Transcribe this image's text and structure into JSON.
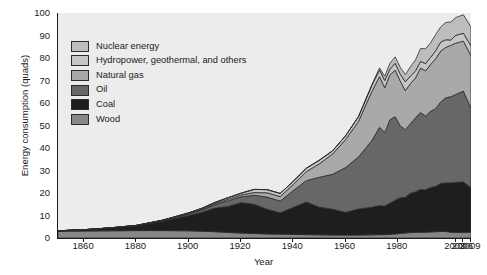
{
  "chart_data": {
    "type": "area",
    "stacked": true,
    "title": "",
    "xlabel": "Year",
    "ylabel": "Energy consumption (quads)",
    "ylim": [
      0,
      100
    ],
    "yticks": [
      0,
      10,
      20,
      30,
      40,
      50,
      60,
      70,
      80,
      90,
      100
    ],
    "xticks": [
      "1860",
      "1880",
      "1900",
      "1920",
      "1940",
      "1960",
      "1980",
      "2003",
      "2006",
      "2009"
    ],
    "xtick_note": "Axis spacing is non-uniform: 1850-1980 is linear, then 2003, 2006, 2009 are compressed at the right.",
    "grid": false,
    "legend_position": "upper-left-inside",
    "x": [
      1850,
      1860,
      1870,
      1880,
      1890,
      1900,
      1905,
      1910,
      1915,
      1920,
      1925,
      1930,
      1935,
      1940,
      1945,
      1950,
      1955,
      1960,
      1965,
      1970,
      1973,
      1975,
      1977,
      1979,
      1981,
      1983,
      1985,
      1987,
      1989,
      1991,
      1993,
      1995,
      1997,
      1999,
      2001,
      2003,
      2006,
      2009
    ],
    "series": [
      {
        "name": "Wood",
        "color": "#878787",
        "values": [
          3.0,
          3.1,
          3.2,
          3.3,
          3.3,
          3.2,
          3.0,
          2.8,
          2.5,
          2.2,
          2.0,
          1.8,
          1.7,
          1.6,
          1.5,
          1.4,
          1.3,
          1.3,
          1.3,
          1.4,
          1.5,
          1.5,
          1.6,
          1.8,
          2.0,
          2.2,
          2.4,
          2.5,
          2.6,
          2.6,
          2.7,
          2.8,
          2.9,
          2.9,
          2.6,
          2.5,
          2.5,
          2.6
        ]
      },
      {
        "name": "Coal",
        "color": "#1e1e1e",
        "values": [
          0.2,
          0.6,
          1.2,
          2.1,
          4.1,
          6.8,
          8.4,
          10.5,
          11.5,
          13.5,
          13.0,
          11.0,
          9.5,
          12.0,
          14.5,
          12.3,
          11.5,
          10.1,
          11.6,
          12.3,
          12.9,
          12.7,
          13.9,
          15.0,
          15.9,
          15.9,
          17.5,
          18.0,
          19.0,
          18.8,
          19.8,
          20.1,
          21.4,
          21.6,
          21.9,
          22.3,
          22.4,
          19.7
        ]
      },
      {
        "name": "Oil",
        "color": "#676767",
        "values": [
          0.0,
          0.0,
          0.1,
          0.2,
          0.4,
          0.6,
          1.0,
          1.5,
          2.5,
          2.6,
          4.0,
          5.4,
          5.2,
          7.5,
          9.5,
          13.3,
          15.5,
          19.9,
          23.2,
          29.5,
          34.8,
          32.7,
          37.1,
          37.1,
          31.9,
          30.0,
          30.9,
          32.9,
          34.2,
          32.8,
          33.8,
          34.6,
          36.2,
          37.8,
          38.3,
          39.0,
          40.4,
          35.3
        ]
      },
      {
        "name": "Natural gas",
        "color": "#a9a9a9",
        "values": [
          0.0,
          0.0,
          0.0,
          0.0,
          0.1,
          0.3,
          0.4,
          0.5,
          0.7,
          0.8,
          1.2,
          1.9,
          2.0,
          2.7,
          4.0,
          6.0,
          9.0,
          12.4,
          15.8,
          21.8,
          22.5,
          19.9,
          19.9,
          20.7,
          19.9,
          17.4,
          17.8,
          17.7,
          19.7,
          20.1,
          20.8,
          22.2,
          22.6,
          22.4,
          22.8,
          22.8,
          22.2,
          23.4
        ]
      },
      {
        "name": "Hydropower, geothermal, and others",
        "color": "#c6c6c6",
        "values": [
          0.0,
          0.0,
          0.0,
          0.0,
          0.0,
          0.3,
          0.4,
          0.5,
          0.7,
          0.8,
          1.4,
          1.4,
          1.4,
          1.4,
          1.5,
          1.6,
          1.4,
          1.7,
          2.1,
          2.7,
          3.0,
          3.2,
          2.5,
          3.1,
          3.1,
          3.9,
          3.4,
          3.1,
          3.0,
          3.2,
          3.2,
          3.5,
          4.0,
          3.4,
          2.4,
          3.5,
          3.5,
          4.4
        ]
      },
      {
        "name": "Nuclear energy",
        "color": "#bdbdbd",
        "values": [
          0.0,
          0.0,
          0.0,
          0.0,
          0.0,
          0.0,
          0.0,
          0.0,
          0.0,
          0.0,
          0.0,
          0.0,
          0.0,
          0.0,
          0.0,
          0.0,
          0.0,
          0.0,
          0.1,
          0.2,
          0.9,
          1.9,
          2.7,
          2.8,
          3.0,
          3.2,
          4.1,
          4.9,
          5.7,
          6.6,
          6.5,
          7.2,
          6.7,
          7.7,
          8.0,
          7.9,
          8.2,
          8.4
        ]
      }
    ],
    "legend_order": [
      "Nuclear energy",
      "Hydropower, geothermal, and others",
      "Natural gas",
      "Oil",
      "Coal",
      "Wood"
    ],
    "legend_colors": {
      "Nuclear energy": "#bdbdbd",
      "Hydropower, geothermal, and others": "#c6c6c6",
      "Natural gas": "#a9a9a9",
      "Oil": "#676767",
      "Coal": "#1e1e1e",
      "Wood": "#878787"
    },
    "plot_background": "#ececec",
    "axis_color": "#1a1a1a"
  }
}
